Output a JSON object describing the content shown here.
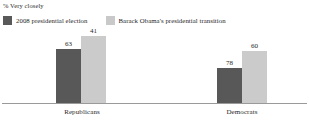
{
  "chart_data": {
    "type": "bar",
    "title": "% Very closely",
    "xlabel": "",
    "ylabel": "",
    "ylim": [
      0,
      100
    ],
    "grid": false,
    "legend_position": "top-left",
    "categories": [
      "Republicans",
      "Democrats"
    ],
    "series": [
      {
        "name": "2008 presidential election",
        "color": "#585858",
        "values": [
          63,
          41
        ]
      },
      {
        "name": "Barack Obama's presidential transition",
        "color": "#cbcbcb",
        "values": [
          78,
          60
        ]
      }
    ]
  },
  "axis_title": "% Very closely",
  "legend": {
    "items": [
      {
        "label": "2008 presidential election",
        "swatch": "dark-swatch-icon"
      },
      {
        "label": "Barack Obama's presidential transition",
        "swatch": "light-swatch-icon"
      }
    ]
  },
  "groups": [
    {
      "category": "Republicans",
      "bars": [
        {
          "value": "63",
          "series": "2008 presidential election"
        },
        {
          "value": "41",
          "series": "Barack Obama's presidential transition"
        }
      ]
    },
    {
      "category": "Democrats",
      "bars": [
        {
          "value": "78",
          "series": "2008 presidential election"
        },
        {
          "value": "60",
          "series": "Barack Obama's presidential transition"
        }
      ]
    }
  ]
}
